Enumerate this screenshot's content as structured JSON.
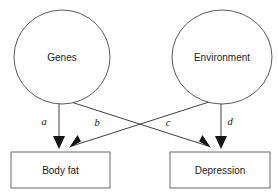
{
  "diagram": {
    "background_color": "#ffffff",
    "line_color": "#2b2b2b",
    "node_stroke_color": "#4a4a4a",
    "text_color": "#1c1c1c",
    "nodes": [
      {
        "id": "genes",
        "label": "Genes",
        "shape": "ellipse",
        "cx": 62,
        "cy": 57,
        "rx": 48,
        "ry": 47
      },
      {
        "id": "environment",
        "label": "Environment",
        "shape": "ellipse",
        "cx": 222,
        "cy": 57,
        "rx": 50,
        "ry": 47
      },
      {
        "id": "body_fat",
        "label": "Body fat",
        "shape": "rect",
        "x": 11,
        "y": 152,
        "width": 99,
        "height": 36
      },
      {
        "id": "depression",
        "label": "Depression",
        "shape": "rect",
        "x": 170,
        "y": 152,
        "width": 100,
        "height": 36
      }
    ],
    "paths": [
      {
        "id": "path-a",
        "label": "a",
        "from": "genes",
        "to": "body_fat",
        "kind": "vertical",
        "x1": 59,
        "y1": 103,
        "x2": 59,
        "y2": 146,
        "label_x": 44,
        "label_y": 123
      },
      {
        "id": "path-b",
        "label": "b",
        "from": "genes",
        "to": "depression",
        "kind": "diagonal",
        "x1": 71,
        "y1": 102,
        "x2": 211,
        "y2": 147,
        "label_x": 97,
        "label_y": 124
      },
      {
        "id": "path-c",
        "label": "c",
        "from": "environment",
        "to": "body_fat",
        "kind": "diagonal",
        "x1": 209,
        "y1": 102,
        "x2": 69,
        "y2": 147,
        "label_x": 168,
        "label_y": 124
      },
      {
        "id": "path-d",
        "label": "d",
        "from": "environment",
        "to": "depression",
        "kind": "vertical",
        "x1": 221,
        "y1": 103,
        "x2": 221,
        "y2": 146,
        "label_x": 230,
        "label_y": 123
      }
    ]
  }
}
